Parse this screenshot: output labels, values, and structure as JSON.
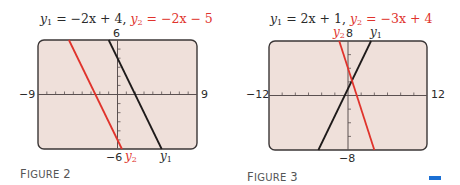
{
  "figures": [
    {
      "title": {
        "y1_var": "y",
        "y1_sub": "1",
        "y1_expr": " = −2x + 4,",
        "y2_var": "y",
        "y2_sub": "2",
        "y2_expr": " = −2x − 5"
      },
      "axis_labels": {
        "ymax": "6",
        "ymin": "−6",
        "xmin": "−9",
        "xmax": "9"
      },
      "line_labels": {
        "y1": "y",
        "y1_sub": "1",
        "y2": "y",
        "y2_sub": "2"
      },
      "caption": {
        "first": "F",
        "rest": "IGURE",
        "num": "2"
      }
    },
    {
      "title": {
        "y1_var": "y",
        "y1_sub": "1",
        "y1_expr": " = 2x + 1,",
        "y2_var": "y",
        "y2_sub": "2",
        "y2_expr": " = −3x + 4"
      },
      "axis_labels": {
        "ymax": "8",
        "ymin": "−8",
        "xmin": "−12",
        "xmax": "12"
      },
      "line_labels": {
        "y1": "y",
        "y1_sub": "1",
        "y2": "y",
        "y2_sub": "2"
      },
      "caption": {
        "first": "F",
        "rest": "IGURE",
        "num": "3"
      }
    }
  ],
  "colors": {
    "screen_bg": "#efe0da",
    "screen_border": "#3b3636",
    "y1_line": "#1e1a1a",
    "y2_line": "#e0332c",
    "marker": "#1a6fd4"
  },
  "chart_data": [
    {
      "type": "line",
      "title": "y1 = −2x + 4, y2 = −2x − 5",
      "caption": "Figure 2",
      "xlim": [
        -9,
        9
      ],
      "ylim": [
        -6,
        6
      ],
      "xscale": 1,
      "yscale": 1,
      "grid": false,
      "series": [
        {
          "name": "y1",
          "slope": -2,
          "intercept": 4,
          "color": "#1e1a1a",
          "x": [
            -1,
            5
          ],
          "y": [
            6,
            -6
          ]
        },
        {
          "name": "y2",
          "slope": -2,
          "intercept": -5,
          "color": "#e0332c",
          "x": [
            -5.5,
            0.5
          ],
          "y": [
            6,
            -6
          ]
        }
      ],
      "box": {
        "left": 38,
        "top": 40,
        "right": 197,
        "bottom": 149
      }
    },
    {
      "type": "line",
      "title": "y1 = 2x + 1, y2 = −3x + 4",
      "caption": "Figure 3",
      "xlim": [
        -12,
        12
      ],
      "ylim": [
        -8,
        8
      ],
      "xscale": 2,
      "yscale": 2,
      "grid": false,
      "series": [
        {
          "name": "y1",
          "slope": 2,
          "intercept": 1,
          "color": "#1e1a1a",
          "x": [
            -4.5,
            3.5
          ],
          "y": [
            -8,
            8
          ]
        },
        {
          "name": "y2",
          "slope": -3,
          "intercept": 4,
          "color": "#e0332c",
          "x": [
            -1.333,
            4
          ],
          "y": [
            8,
            -8
          ]
        }
      ],
      "box": {
        "left": 269,
        "top": 41,
        "right": 427,
        "bottom": 150
      }
    }
  ]
}
